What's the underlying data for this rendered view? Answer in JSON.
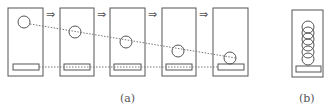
{
  "panel_a": {
    "label": "(a)",
    "arrow_glyph": "⇒",
    "frames": [
      {
        "x": 8,
        "ball_cy": 22
      },
      {
        "x": 60,
        "ball_cy": 32
      },
      {
        "x": 110,
        "ball_cy": 42
      },
      {
        "x": 162,
        "ball_cy": 51
      },
      {
        "x": 213,
        "ball_cy": 60
      }
    ]
  },
  "panel_b": {
    "label": "(b)",
    "stacked_circles": 6
  },
  "colors": {
    "stroke": "#555555",
    "dotted": "#777777"
  }
}
